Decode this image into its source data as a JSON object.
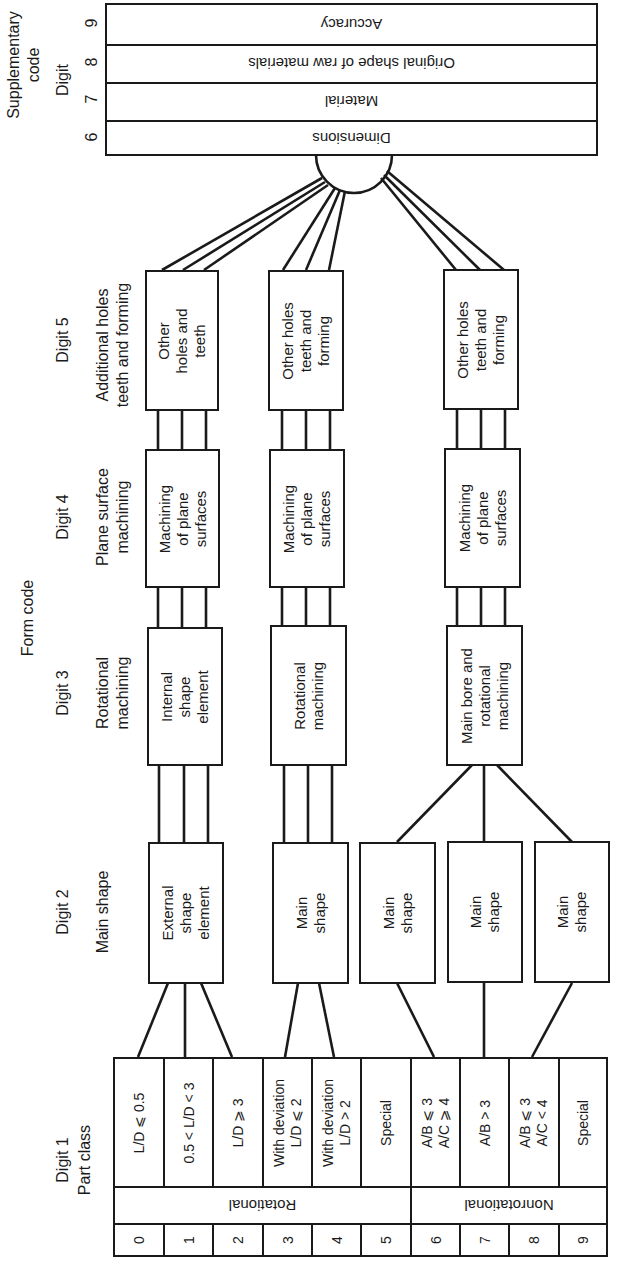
{
  "title_labels": {
    "supplementary_code": "Supplementary\ncode",
    "supplementary_digit": "Digit",
    "form_code": "Form code"
  },
  "supplementary": {
    "rows": [
      {
        "digit": "9",
        "label": "Accuracy"
      },
      {
        "digit": "8",
        "label": "Original shape of raw materials"
      },
      {
        "digit": "7",
        "label": "Material"
      },
      {
        "digit": "6",
        "label": "Dimensions"
      }
    ]
  },
  "digit_headers": {
    "d5": {
      "digit": "Digit 5",
      "desc": "Additional holes\nteeth and forming"
    },
    "d4": {
      "digit": "Digit 4",
      "desc": "Plane surface\nmachining"
    },
    "d3": {
      "digit": "Digit 3",
      "desc": "Rotational\nmachining"
    },
    "d2": {
      "digit": "Digit 2",
      "desc": "Main shape"
    },
    "d1": {
      "digit": "Digit 1",
      "desc": "Part class"
    }
  },
  "boxes": {
    "d5": [
      "Other\nholes and\nteeth",
      "Other holes\nteeth and\nforming",
      "Other holes\nteeth and\nforming"
    ],
    "d4": [
      "Machining\nof plane\nsurfaces",
      "Machining\nof plane\nsurfaces",
      "Machining\nof plane\nsurfaces"
    ],
    "d3": [
      "Internal\nshape\nelement",
      "Rotational\nmachining",
      "Main bore and\nrotational\nmachining"
    ],
    "d2": [
      "External\nshape\nelement",
      "Main\nshape",
      "Main\nshape",
      "Main\nshape",
      "Main\nshape"
    ]
  },
  "part_class": {
    "classes": [
      {
        "digit": "0",
        "label": "L/D ⩽ 0.5"
      },
      {
        "digit": "1",
        "label": "0.5 < L/D < 3"
      },
      {
        "digit": "2",
        "label": "L/D ⩾ 3"
      },
      {
        "digit": "3",
        "label": "With deviation\nL/D ⩽ 2"
      },
      {
        "digit": "4",
        "label": "With deviation\nL/D > 2"
      },
      {
        "digit": "5",
        "label": "Special"
      },
      {
        "digit": "6",
        "label": "A/B ⩽ 3\nA/C ⩾ 4"
      },
      {
        "digit": "7",
        "label": "A/B > 3"
      },
      {
        "digit": "8",
        "label": "A/B ⩽ 3\nA/C < 4"
      },
      {
        "digit": "9",
        "label": "Special"
      }
    ],
    "categories": [
      {
        "label": "Rotational",
        "span": 6
      },
      {
        "label": "Nonrotational",
        "span": 4
      }
    ]
  }
}
